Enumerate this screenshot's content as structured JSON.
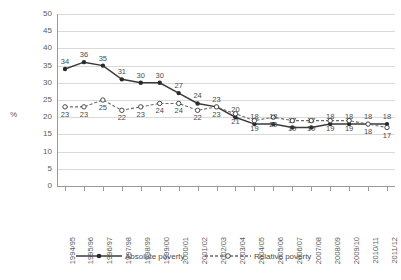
{
  "chart_data": {
    "type": "line",
    "title": "",
    "xlabel": "",
    "ylabel": "%",
    "ylim": [
      0,
      50
    ],
    "ytick_step": 5,
    "yticks": [
      50,
      45,
      40,
      35,
      30,
      25,
      20,
      15,
      10,
      5,
      0
    ],
    "grid": true,
    "legend_position": "bottom",
    "categories": [
      "1994/95",
      "1995/96",
      "1996/97",
      "1997/98",
      "1998/99",
      "1999/00",
      "2000/01",
      "2001/02",
      "2002/03",
      "2003/04",
      "2004/05",
      "2005/06",
      "2006/07",
      "2007/08",
      "2008/09",
      "2009/10",
      "2010/11",
      "2011/12"
    ],
    "series": [
      {
        "name": "Absolute poverty",
        "style": "solid",
        "marker": "filled-circle",
        "color": "#3a3a3a",
        "values": [
          34,
          36,
          35,
          31,
          30,
          30,
          27,
          24,
          23,
          20,
          18,
          18,
          17,
          17,
          18,
          18,
          18,
          18
        ]
      },
      {
        "name": "Relative poverty",
        "style": "dashed",
        "marker": "hollow-circle",
        "color": "#6a6a6a",
        "values": [
          23,
          23,
          25,
          22,
          23,
          24,
          24,
          22,
          23,
          21,
          19,
          20,
          19,
          19,
          19,
          19,
          18,
          17
        ]
      }
    ]
  },
  "legend": {
    "absolute_label": "Absolute poverty",
    "relative_label": "Relative poverty"
  },
  "axis": {
    "y_title": "%"
  }
}
